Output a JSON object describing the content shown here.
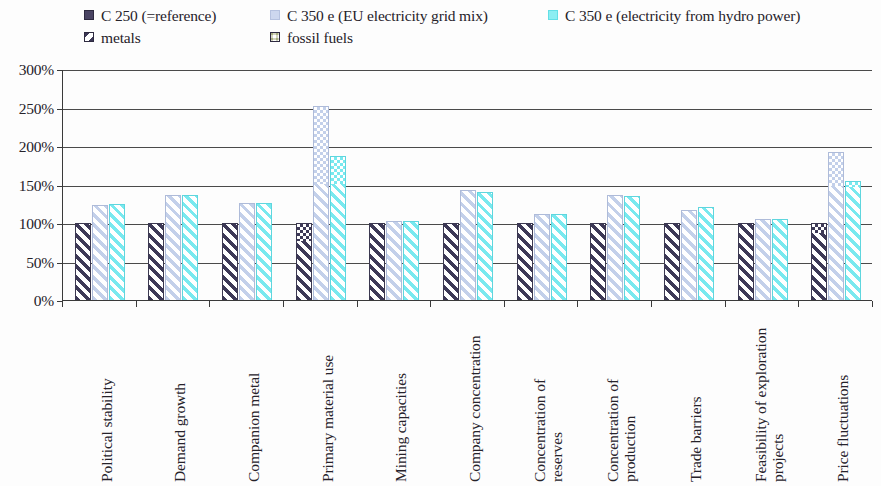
{
  "legend": {
    "entries": [
      {
        "id": "c250",
        "label": "C 250 (=reference)",
        "swatch": "legend-swatch-c250",
        "color": "#4a4463"
      },
      {
        "id": "c350eu",
        "label": "C 350 e (EU electricity grid mix)",
        "swatch": "legend-swatch-c350-eu",
        "color": "#cdd7ef"
      },
      {
        "id": "c350hy",
        "label": "C 350 e (electricity from hydro power)",
        "swatch": "legend-swatch-c350-hydro",
        "color": "#8ceef2"
      },
      {
        "id": "metals",
        "label": "metals",
        "swatch": "legend-swatch-metals",
        "color": "#3c3856"
      },
      {
        "id": "fossil",
        "label": "fossil fuels",
        "swatch": "legend-swatch-fossil",
        "color": "#2c2940"
      }
    ]
  },
  "chart_data": {
    "type": "bar",
    "title": "",
    "subtitle": "",
    "xlabel": "",
    "ylabel": "",
    "stacked": true,
    "grouped": true,
    "grid": true,
    "legend_position": "top",
    "ylim": [
      0,
      300
    ],
    "ytick_labels": [
      "300%",
      "250%",
      "200%",
      "150%",
      "100%",
      "50%",
      "0%"
    ],
    "ytick_values": [
      300,
      250,
      200,
      150,
      100,
      50,
      0
    ],
    "unit": "%",
    "stack_components": [
      "metals",
      "fossil fuels"
    ],
    "categories": [
      "Political stability",
      "Demand growth",
      "Companion metal",
      "Primary material use",
      "Mining capacities",
      "Company concentration",
      "Concentration of reserves",
      "Concentration of production",
      "Trade barriers",
      "Feasibility of exploration projects",
      "Price fluctuations"
    ],
    "category_lines": [
      [
        "Political stability"
      ],
      [
        "Demand growth"
      ],
      [
        "Companion metal"
      ],
      [
        "Primary material use"
      ],
      [
        "Mining capacities"
      ],
      [
        "Company concentration"
      ],
      [
        "Concentration of",
        "reserves"
      ],
      [
        "Concentration of",
        "production"
      ],
      [
        "Trade barriers"
      ],
      [
        "Feasibility of exploration",
        "projects"
      ],
      [
        "Price fluctuations"
      ]
    ],
    "series": [
      {
        "name": "C 250 (=reference)",
        "color": "#3d3957",
        "totals": [
          100,
          100,
          100,
          100,
          100,
          100,
          100,
          100,
          100,
          100,
          100
        ],
        "metals": [
          100,
          100,
          100,
          78,
          100,
          100,
          100,
          100,
          100,
          100,
          88
        ],
        "fossil": [
          0,
          0,
          0,
          22,
          0,
          0,
          0,
          0,
          0,
          0,
          12
        ]
      },
      {
        "name": "C 350 e (EU electricity grid mix)",
        "color": "#c3d0ea",
        "totals": [
          124,
          137,
          126,
          252,
          103,
          143,
          112,
          137,
          117,
          105,
          192
        ],
        "metals": [
          124,
          137,
          126,
          152,
          103,
          143,
          112,
          137,
          117,
          105,
          150
        ],
        "fossil": [
          0,
          0,
          0,
          100,
          0,
          0,
          0,
          0,
          0,
          0,
          42
        ]
      },
      {
        "name": "C 350 e (electricity from hydro power)",
        "color": "#79e9ef",
        "totals": [
          125,
          137,
          126,
          187,
          103,
          140,
          112,
          135,
          121,
          105,
          155
        ],
        "metals": [
          125,
          137,
          126,
          152,
          103,
          140,
          112,
          135,
          121,
          105,
          148
        ],
        "fossil": [
          0,
          0,
          0,
          35,
          0,
          0,
          0,
          0,
          0,
          0,
          7
        ]
      }
    ]
  }
}
